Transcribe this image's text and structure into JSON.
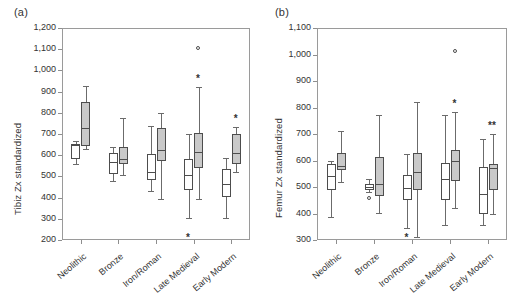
{
  "figure": {
    "panels": [
      {
        "label": "(a)",
        "ylabel": "Tibiz Zx standardized",
        "yticks": [
          "1,200",
          "1,100",
          "1,000",
          "900",
          "800",
          "700",
          "600",
          "500",
          "400",
          "300",
          "200"
        ],
        "ylim": [
          200,
          1200
        ],
        "categories": [
          "Neolithic",
          "Bronze",
          "Iron/Roman",
          "Late Medieval",
          "Early Modern"
        ]
      },
      {
        "label": "(b)",
        "ylabel": "Femur Zx standardized",
        "yticks": [
          "1,100",
          "1,000",
          "900",
          "800",
          "700",
          "600",
          "500",
          "400",
          "300"
        ],
        "ylim": [
          300,
          1100
        ],
        "categories": [
          "Neolithic",
          "Bronze",
          "Iron/Roman",
          "Late Medieval",
          "Early Modern"
        ]
      }
    ]
  },
  "chart_data": [
    {
      "type": "box",
      "title": "(a)",
      "xlabel": "",
      "ylabel": "Tibiz Zx standardized",
      "ylim": [
        200,
        1200
      ],
      "ytick_values": [
        200,
        300,
        400,
        500,
        600,
        700,
        800,
        900,
        1000,
        1100,
        1200
      ],
      "grid": false,
      "legend": "none",
      "categories": [
        "Neolithic",
        "Bronze",
        "Iron/Roman",
        "Late Medieval",
        "Early Modern"
      ],
      "series": [
        {
          "name": "white",
          "boxes": [
            {
              "category": "Neolithic",
              "whisker_low": 557,
              "q1": 580,
              "median": 648,
              "q3": 652,
              "whisker_high": 665,
              "outliers": []
            },
            {
              "category": "Bronze",
              "whisker_low": 478,
              "q1": 512,
              "median": 570,
              "q3": 612,
              "whisker_high": 640,
              "outliers": []
            },
            {
              "category": "Iron/Roman",
              "whisker_low": 430,
              "q1": 485,
              "median": 523,
              "q3": 608,
              "whisker_high": 738,
              "outliers": []
            },
            {
              "category": "Late Medieval",
              "whisker_low": 303,
              "q1": 438,
              "median": 508,
              "q3": 580,
              "whisker_high": 700,
              "outliers": [],
              "annotation": "*"
            },
            {
              "category": "Early Modern",
              "whisker_low": 305,
              "q1": 403,
              "median": 462,
              "q3": 533,
              "whisker_high": 588,
              "outliers": []
            }
          ]
        },
        {
          "name": "gray",
          "boxes": [
            {
              "category": "Neolithic",
              "whisker_low": 630,
              "q1": 645,
              "median": 728,
              "q3": 850,
              "whisker_high": 925,
              "outliers": []
            },
            {
              "category": "Bronze",
              "whisker_low": 505,
              "q1": 558,
              "median": 583,
              "q3": 640,
              "whisker_high": 775,
              "outliers": []
            },
            {
              "category": "Iron/Roman",
              "whisker_low": 393,
              "q1": 573,
              "median": 623,
              "q3": 728,
              "whisker_high": 800,
              "outliers": []
            },
            {
              "category": "Late Medieval",
              "whisker_low": 393,
              "q1": 540,
              "median": 617,
              "q3": 703,
              "whisker_high": 920,
              "outliers": [
                1105
              ],
              "annotation": "*"
            },
            {
              "category": "Early Modern",
              "whisker_low": 522,
              "q1": 558,
              "median": 612,
              "q3": 702,
              "whisker_high": 733,
              "outliers": [],
              "annotation": "*"
            }
          ]
        }
      ]
    },
    {
      "type": "box",
      "title": "(b)",
      "xlabel": "",
      "ylabel": "Femur Zx standardized",
      "ylim": [
        300,
        1100
      ],
      "ytick_values": [
        300,
        400,
        500,
        600,
        700,
        800,
        900,
        1000,
        1100
      ],
      "grid": false,
      "legend": "none",
      "categories": [
        "Neolithic",
        "Bronze",
        "Iron/Roman",
        "Late Medieval",
        "Early Modern"
      ],
      "series": [
        {
          "name": "white",
          "boxes": [
            {
              "category": "Neolithic",
              "whisker_low": 385,
              "q1": 487,
              "median": 543,
              "q3": 588,
              "whisker_high": 600,
              "outliers": []
            },
            {
              "category": "Bronze",
              "whisker_low": 480,
              "q1": 490,
              "median": 500,
              "q3": 512,
              "whisker_high": 530,
              "outliers": [
                455
              ]
            },
            {
              "category": "Iron/Roman",
              "whisker_low": 345,
              "q1": 450,
              "median": 498,
              "q3": 545,
              "whisker_high": 625,
              "outliers": [],
              "annotation": "*"
            },
            {
              "category": "Late Medieval",
              "whisker_low": 358,
              "q1": 450,
              "median": 530,
              "q3": 590,
              "whisker_high": 770,
              "outliers": []
            },
            {
              "category": "Early Modern",
              "whisker_low": 358,
              "q1": 398,
              "median": 475,
              "q3": 575,
              "whisker_high": 682,
              "outliers": []
            }
          ]
        },
        {
          "name": "gray",
          "boxes": [
            {
              "category": "Neolithic",
              "whisker_low": 520,
              "q1": 565,
              "median": 580,
              "q3": 630,
              "whisker_high": 712,
              "outliers": []
            },
            {
              "category": "Bronze",
              "whisker_low": 403,
              "q1": 467,
              "median": 512,
              "q3": 615,
              "whisker_high": 770,
              "outliers": []
            },
            {
              "category": "Iron/Roman",
              "whisker_low": 310,
              "q1": 487,
              "median": 555,
              "q3": 628,
              "whisker_high": 822,
              "outliers": []
            },
            {
              "category": "Late Medieval",
              "whisker_low": 420,
              "q1": 522,
              "median": 600,
              "q3": 640,
              "whisker_high": 782,
              "outliers": [
                1013
              ],
              "annotation": "*"
            },
            {
              "category": "Early Modern",
              "whisker_low": 400,
              "q1": 490,
              "median": 570,
              "q3": 585,
              "whisker_high": 700,
              "outliers": [],
              "annotation": "**"
            }
          ]
        }
      ]
    }
  ]
}
